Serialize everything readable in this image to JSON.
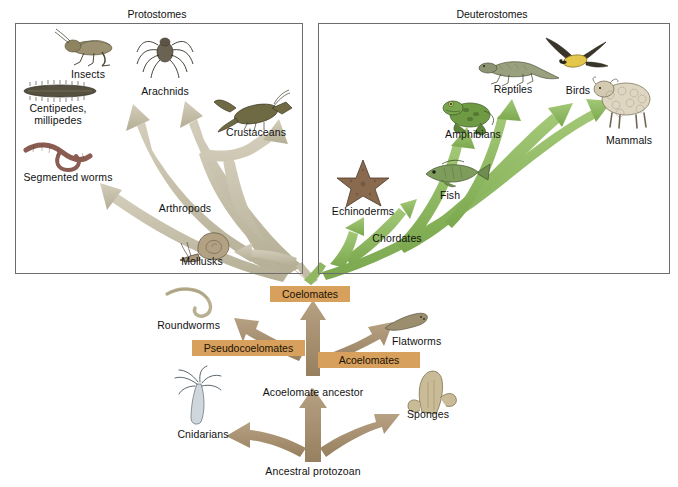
{
  "figure": {
    "type": "phylogenetic-tree-diagram",
    "colors": {
      "protostome_arrow": "#c3bda6",
      "deuterostome_arrow": "#8fb861",
      "ancestral_arrow": "#a89070",
      "label_box": "#d7a05c",
      "panel_border": "#6d6d6d",
      "text": "#111111"
    }
  },
  "panels": {
    "protostomes": {
      "title": "Protostomes",
      "title_x": 157,
      "title_y": 14,
      "box": {
        "x": 15,
        "y": 23,
        "w": 286,
        "h": 249
      },
      "labels": [
        {
          "text": "Insects",
          "x": 88,
          "y": 74,
          "align": "center"
        },
        {
          "text": "Arachnids",
          "x": 165,
          "y": 91,
          "align": "center"
        },
        {
          "text": "Centipedes,",
          "x": 58,
          "y": 108,
          "align": "center"
        },
        {
          "text": "millipedes",
          "x": 58,
          "y": 120,
          "align": "center"
        },
        {
          "text": "Crustaceans",
          "x": 256,
          "y": 132,
          "align": "center"
        },
        {
          "text": "Segmented worms",
          "x": 68,
          "y": 177,
          "align": "center"
        },
        {
          "text": "Arthropods",
          "x": 185,
          "y": 208,
          "align": "center"
        },
        {
          "text": "Mollusks",
          "x": 202,
          "y": 261,
          "align": "center"
        }
      ],
      "organisms": [
        {
          "name": "grasshopper-insect",
          "x": 60,
          "y": 32
        },
        {
          "name": "spider-arachnid",
          "x": 143,
          "y": 30
        },
        {
          "name": "millipede",
          "x": 22,
          "y": 82
        },
        {
          "name": "lobster-crustacean",
          "x": 216,
          "y": 96
        },
        {
          "name": "earthworm-annelid",
          "x": 24,
          "y": 140
        },
        {
          "name": "snail-mollusk",
          "x": 180,
          "y": 228
        }
      ]
    },
    "deuterostomes": {
      "title": "Deuterostomes",
      "title_x": 492,
      "title_y": 14,
      "box": {
        "x": 318,
        "y": 23,
        "w": 350,
        "h": 249
      },
      "labels": [
        {
          "text": "Reptiles",
          "x": 513,
          "y": 89,
          "align": "center"
        },
        {
          "text": "Birds",
          "x": 578,
          "y": 90,
          "align": "center"
        },
        {
          "text": "Amphibians",
          "x": 473,
          "y": 134,
          "align": "center"
        },
        {
          "text": "Mammals",
          "x": 629,
          "y": 140,
          "align": "center"
        },
        {
          "text": "Fish",
          "x": 450,
          "y": 195,
          "align": "center"
        },
        {
          "text": "Echinoderms",
          "x": 363,
          "y": 211,
          "align": "center"
        },
        {
          "text": "Chordates",
          "x": 397,
          "y": 238,
          "align": "center"
        }
      ],
      "organisms": [
        {
          "name": "lizard-reptile",
          "x": 477,
          "y": 52
        },
        {
          "name": "bird-flying",
          "x": 546,
          "y": 40
        },
        {
          "name": "frog-amphibian",
          "x": 444,
          "y": 95
        },
        {
          "name": "sheep-mammal",
          "x": 592,
          "y": 75
        },
        {
          "name": "starfish-echinoderm",
          "x": 337,
          "y": 158
        },
        {
          "name": "fish",
          "x": 418,
          "y": 160
        }
      ]
    }
  },
  "tree": {
    "boxes": [
      {
        "label": "Coelomates",
        "x": 270,
        "y": 286,
        "w": 80,
        "h": 16
      },
      {
        "label": "Pseudocoelomates",
        "x": 192,
        "y": 340,
        "w": 113,
        "h": 16
      },
      {
        "label": "Acoelomates",
        "x": 318,
        "y": 352,
        "w": 102,
        "h": 16
      }
    ],
    "labels": [
      {
        "text": "Roundworms",
        "x": 220,
        "y": 325,
        "align": "right"
      },
      {
        "text": "Flatworms",
        "x": 392,
        "y": 341,
        "align": "left"
      },
      {
        "text": "Acoelomate ancestor",
        "x": 313,
        "y": 392,
        "align": "center"
      },
      {
        "text": "Cnidarians",
        "x": 203,
        "y": 434,
        "align": "center"
      },
      {
        "text": "Sponges",
        "x": 428,
        "y": 414,
        "align": "center"
      },
      {
        "text": "Ancestral protozoan",
        "x": 313,
        "y": 471,
        "align": "center"
      }
    ],
    "organisms": [
      {
        "name": "roundworm-nematode",
        "x": 165,
        "y": 288
      },
      {
        "name": "flatworm",
        "x": 383,
        "y": 312
      },
      {
        "name": "hydra-cnidarian",
        "x": 175,
        "y": 370
      },
      {
        "name": "sponge",
        "x": 408,
        "y": 368
      }
    ]
  }
}
